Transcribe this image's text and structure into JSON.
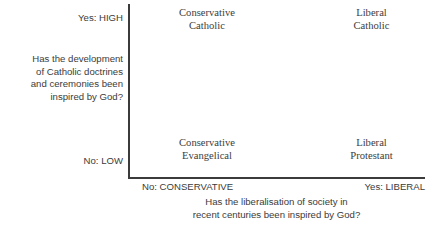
{
  "chart_data": {
    "type": "scatter",
    "title": "",
    "subtitle": "",
    "layout": "2x2-quadrant-matrix",
    "grid": false,
    "legend": null,
    "xlabel": "Has the liberalisation of society in\nrecent centuries been inspired by God?",
    "ylabel": "Has the development\nof Catholic doctrines\nand ceremonies been\ninspired by God?",
    "xticklabels": [
      "No: CONSERVATIVE",
      "Yes: LIBERAL"
    ],
    "yticklabels": [
      "No: LOW",
      "Yes: HIGH"
    ],
    "xlim": [
      "No: CONSERVATIVE",
      "Yes: LIBERAL"
    ],
    "ylim": [
      "No: LOW",
      "Yes: HIGH"
    ],
    "quadrants": [
      {
        "position": "top-left",
        "x": "No: CONSERVATIVE",
        "y": "Yes: HIGH",
        "label": "Conservative\nCatholic"
      },
      {
        "position": "top-right",
        "x": "Yes: LIBERAL",
        "y": "Yes: HIGH",
        "label": "Liberal\nCatholic"
      },
      {
        "position": "bottom-left",
        "x": "No: CONSERVATIVE",
        "y": "No: LOW",
        "label": "Conservative\nEvangelical"
      },
      {
        "position": "bottom-right",
        "x": "Yes: LIBERAL",
        "y": "No: LOW",
        "label": "Liberal\nProtestant"
      }
    ],
    "colors": {
      "axis": "#3b3b3b",
      "quadrant_text": "#3c3c3c",
      "axis_text": "#3b3b3b",
      "background": "#ffffff"
    }
  },
  "axes": {
    "y": {
      "title": "Has the development\nof Catholic doctrines\nand ceremonies been\ninspired by God?",
      "tick_high": "Yes: HIGH",
      "tick_low": "No: LOW"
    },
    "x": {
      "title": "Has the liberalisation of society in\nrecent centuries been inspired by God?",
      "tick_left": "No: CONSERVATIVE",
      "tick_right": "Yes: LIBERAL"
    }
  },
  "quadrant_labels": {
    "top_left": "Conservative\nCatholic",
    "top_right": "Liberal\nCatholic",
    "bottom_left": "Conservative\nEvangelical",
    "bottom_right": "Liberal\nProtestant"
  }
}
